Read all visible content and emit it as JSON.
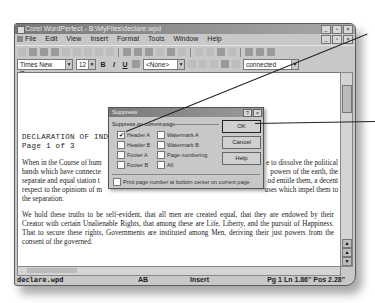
{
  "window": {
    "title": "Corel WordPerfect - B:\\MyFiles\\declare.wpd",
    "controls": [
      "_",
      "▫",
      "×"
    ]
  },
  "menubar": {
    "items": [
      "File",
      "Edit",
      "View",
      "Insert",
      "Format",
      "Tools",
      "Window",
      "Help"
    ]
  },
  "propbar": {
    "font": "Times New Roman",
    "size": "12",
    "style": "<None>",
    "zoom": "connected"
  },
  "document": {
    "heading_line1": "DECLARATION OF IND",
    "heading_line2": "Page 1 of 3",
    "paragraph1_left": "When in the Course of hum\nbands which have connecte\nseparate and equal station t\nrespect to the opinions of m\nthe separation.",
    "paragraph1_right": "e to dissolve the political\n powers of the earth, the\nod entitle them, a decent\nuses which impel them to",
    "paragraph2": "We hold these truths to be self-evident, that all men are created equal, that they are endowed by their Creator with certain Unalienable Rights, that among these are Life, Liberty, and the pursuit of Happiness.  That to secure these rights, Governments are instituted among Men, deriving their just powers from the consent of the governed."
  },
  "dialog": {
    "title": "Suppress",
    "help_glyph": "?",
    "close_glyph": "×",
    "group_label": "Suppress on current page",
    "checkboxes": [
      {
        "label": "Header A",
        "checked": true
      },
      {
        "label": "Header B",
        "checked": false
      },
      {
        "label": "Footer A",
        "checked": false
      },
      {
        "label": "Footer B",
        "checked": false
      },
      {
        "label": "Watermark A",
        "checked": false
      },
      {
        "label": "Watermark B",
        "checked": false
      },
      {
        "label": "Page numbering",
        "checked": false
      },
      {
        "label": "All",
        "checked": false
      }
    ],
    "print_option": {
      "label": "Print page number at bottom center on current page",
      "checked": false
    },
    "buttons": {
      "ok": "OK",
      "cancel": "Cancel",
      "help": "Help"
    }
  },
  "statusbar": {
    "filename": "declare.wpd",
    "mode": "AB",
    "insert": "Insert",
    "position": "Pg 1 Ln 1.86\" Pos 2.28\""
  }
}
